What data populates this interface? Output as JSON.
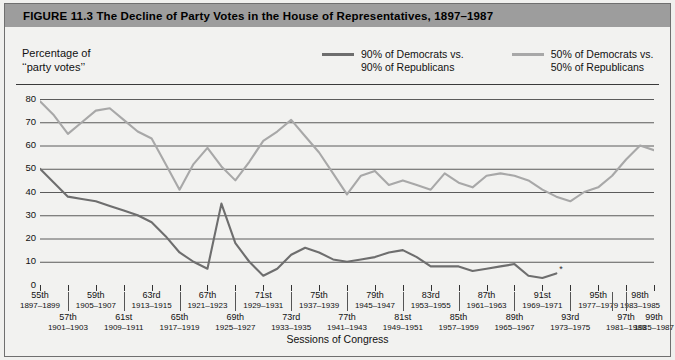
{
  "figure": {
    "title": "FIGURE 11.3   The Decline of Party Votes in the House of Representatives, 1897–1987",
    "title_bar_color": "#9d9d9d"
  },
  "axes": {
    "y_caption_line1": "Percentage of",
    "y_caption_line2": "‘‘party votes’’",
    "x_title": "Sessions of Congress"
  },
  "legend": {
    "items": [
      {
        "label_line1": "90% of Democrats vs.",
        "label_line2": "90% of Republicans",
        "color": "#6e6e6e"
      },
      {
        "label_line1": "50% of Democrats vs.",
        "label_line2": "50% of Republicans",
        "color": "#a8a8a8"
      }
    ]
  },
  "chart_data": {
    "type": "line",
    "title": "The Decline of Party Votes in the House of Representatives, 1897–1987",
    "xlabel": "Sessions of Congress",
    "ylabel": "Percentage of ‘‘party votes’’",
    "ylim": [
      0,
      80
    ],
    "yticks": [
      0,
      10,
      20,
      30,
      40,
      50,
      60,
      70,
      80
    ],
    "grid": true,
    "legend_position": "top-right",
    "categories": [
      "55th",
      "56th",
      "57th",
      "58th",
      "59th",
      "60th",
      "61st",
      "62nd",
      "63rd",
      "64th",
      "65th",
      "66th",
      "67th",
      "68th",
      "69th",
      "70th",
      "71st",
      "72nd",
      "73rd",
      "74th",
      "75th",
      "76th",
      "77th",
      "78th",
      "79th",
      "80th",
      "81st",
      "82nd",
      "83rd",
      "84th",
      "85th",
      "86th",
      "87th",
      "88th",
      "89th",
      "90th",
      "91st",
      "92nd",
      "93rd",
      "94th",
      "95th",
      "96th",
      "97th",
      "98th",
      "99th"
    ],
    "category_years": [
      "1897–1899",
      "1899–1901",
      "1901–1903",
      "1903–1905",
      "1905–1907",
      "1907–1909",
      "1909–1911",
      "1911–1913",
      "1913–1915",
      "1915–1917",
      "1917–1919",
      "1919–1921",
      "1921–1923",
      "1923–1925",
      "1925–1927",
      "1927–1929",
      "1929–1931",
      "1931–1933",
      "1933–1935",
      "1935–1937",
      "1937–1939",
      "1939–1941",
      "1941–1943",
      "1943–1945",
      "1945–1947",
      "1947–1949",
      "1949–1951",
      "1951–1953",
      "1953–1955",
      "1955–1957",
      "1957–1959",
      "1959–1961",
      "1961–1963",
      "1963–1965",
      "1965–1967",
      "1967–1969",
      "1969–1971",
      "1971–1973",
      "1973–1975",
      "1975–1977",
      "1977–1979",
      "1979–1981",
      "1981–1983",
      "1983–1985",
      "1985–1987"
    ],
    "series": [
      {
        "name": "50% of Democrats vs. 50% of Republicans",
        "color": "#a8a8a8",
        "values": [
          79,
          73,
          65,
          70,
          75,
          76,
          71,
          66,
          63,
          52,
          41,
          52,
          59,
          51,
          45,
          53,
          62,
          66,
          71,
          64,
          57,
          48,
          39,
          47,
          49,
          43,
          45,
          43,
          41,
          48,
          44,
          42,
          47,
          48,
          47,
          45,
          41,
          38,
          36,
          40,
          42,
          47,
          54,
          60,
          58
        ]
      },
      {
        "name": "90% of Democrats vs. 90% of Republicans",
        "color": "#6e6e6e",
        "values": [
          50,
          44,
          38,
          37,
          36,
          34,
          32,
          30,
          27,
          21,
          14,
          10,
          7,
          35,
          18,
          10,
          4,
          7,
          13,
          16,
          14,
          11,
          10,
          11,
          12,
          14,
          15,
          12,
          8,
          8,
          8,
          6,
          7,
          8,
          9,
          4,
          3,
          5,
          null,
          null,
          null,
          null,
          null,
          null,
          null
        ],
        "end_marker": "*",
        "end_marker_index": 37
      }
    ],
    "x_tick_labels_top_row": [
      {
        "session": "55th",
        "years": "1897–1899",
        "index": 0
      },
      {
        "session": "59th",
        "years": "1905–1907",
        "index": 4
      },
      {
        "session": "63rd",
        "years": "1913–1915",
        "index": 8
      },
      {
        "session": "67th",
        "years": "1921–1923",
        "index": 12
      },
      {
        "session": "71st",
        "years": "1929–1931",
        "index": 16
      },
      {
        "session": "75th",
        "years": "1937–1939",
        "index": 20
      },
      {
        "session": "79th",
        "years": "1945–1947",
        "index": 24
      },
      {
        "session": "83rd",
        "years": "1953–1955",
        "index": 28
      },
      {
        "session": "87th",
        "years": "1961–1963",
        "index": 32
      },
      {
        "session": "91st",
        "years": "1969–1971",
        "index": 36
      },
      {
        "session": "95th",
        "years": "1977–1979",
        "index": 40
      },
      {
        "session": "98th",
        "years": "1983–1985",
        "index": 43
      }
    ],
    "x_tick_labels_bottom_row": [
      {
        "session": "57th",
        "years": "1901–1903",
        "index": 2
      },
      {
        "session": "61st",
        "years": "1909–1911",
        "index": 6
      },
      {
        "session": "65th",
        "years": "1917–1919",
        "index": 10
      },
      {
        "session": "69th",
        "years": "1925–1927",
        "index": 14
      },
      {
        "session": "73rd",
        "years": "1933–1935",
        "index": 18
      },
      {
        "session": "77th",
        "years": "1941–1943",
        "index": 22
      },
      {
        "session": "81st",
        "years": "1949–1951",
        "index": 26
      },
      {
        "session": "85th",
        "years": "1957–1959",
        "index": 30
      },
      {
        "session": "89th",
        "years": "1965–1967",
        "index": 34
      },
      {
        "session": "93rd",
        "years": "1973–1975",
        "index": 38
      },
      {
        "session": "97th",
        "years": "1981–1983",
        "index": 42
      },
      {
        "session": "99th",
        "years": "1985–1987",
        "index": 44
      }
    ]
  }
}
